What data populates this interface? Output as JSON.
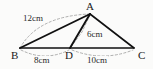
{
  "figure": {
    "type": "geometry-diagram",
    "background_color": "#fbfbfa",
    "stroke_color": "#111111",
    "dash_color": "#8a8a8a",
    "vertices": [
      {
        "id": "A",
        "label": "A",
        "x": 90,
        "y": 14
      },
      {
        "id": "B",
        "label": "B",
        "x": 20,
        "y": 48
      },
      {
        "id": "D",
        "label": "D",
        "x": 70,
        "y": 48
      },
      {
        "id": "C",
        "label": "C",
        "x": 134,
        "y": 48
      }
    ],
    "solid_edges": [
      {
        "name": "edge-BA",
        "from": "B",
        "to": "A"
      },
      {
        "name": "edge-AC",
        "from": "A",
        "to": "C"
      },
      {
        "name": "edge-BC",
        "from": "B",
        "to": "C"
      },
      {
        "name": "edge-AD",
        "from": "A",
        "to": "D"
      }
    ],
    "measurements": [
      {
        "id": "m-BA",
        "label": "12cm",
        "value": 12,
        "unit": "cm",
        "segment": "BA"
      },
      {
        "id": "m-AD",
        "label": "6cm",
        "value": 6,
        "unit": "cm",
        "segment": "AD"
      },
      {
        "id": "m-BD",
        "label": "8cm",
        "value": 8,
        "unit": "cm",
        "segment": "BD"
      },
      {
        "id": "m-DC",
        "label": "10cm",
        "value": 10,
        "unit": "cm",
        "segment": "DC"
      }
    ]
  }
}
